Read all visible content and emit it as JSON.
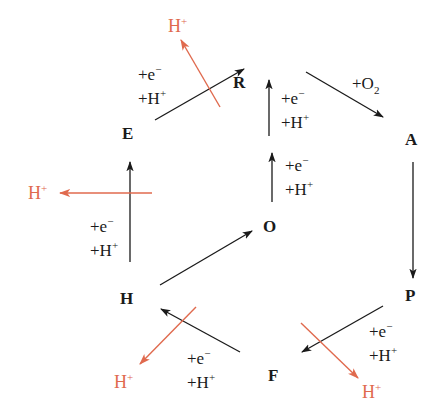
{
  "colors": {
    "black": "#1a1a1a",
    "proton_red": "#e06a4e",
    "background": "#ffffff"
  },
  "nodes": {
    "R": "R",
    "A": "A",
    "P": "P",
    "F": "F",
    "H": "H",
    "E": "E",
    "O": "O"
  },
  "labels": {
    "e_minus": "+e",
    "e_minus_sup": "−",
    "h_plus": "+H",
    "h_plus_sup": "+",
    "o2": "+O",
    "o2_sub": "2",
    "proton": "H",
    "proton_sup": "+"
  },
  "edges": [
    {
      "from": "E",
      "to": "R",
      "label": [
        "+e−",
        "+H+"
      ],
      "proton_release": true
    },
    {
      "from": "R",
      "to": "A",
      "label": [
        "+O2"
      ],
      "proton_release": false
    },
    {
      "from": "A",
      "to": "P",
      "label": [],
      "proton_release": false
    },
    {
      "from": "P",
      "to": "F",
      "label": [
        "+e−",
        "+H+"
      ],
      "proton_release": true
    },
    {
      "from": "F",
      "to": "H",
      "label": [
        "+e−",
        "+H+"
      ],
      "proton_release": true
    },
    {
      "from": "H",
      "to": "O",
      "label": [],
      "proton_release": false
    },
    {
      "from": "O",
      "to": "R",
      "label": [
        "+e−",
        "+H+",
        "+e−",
        "+H+"
      ],
      "proton_release": false
    },
    {
      "from": "H",
      "to": "E",
      "label": [
        "+e−",
        "+H+"
      ],
      "proton_release": true
    }
  ]
}
